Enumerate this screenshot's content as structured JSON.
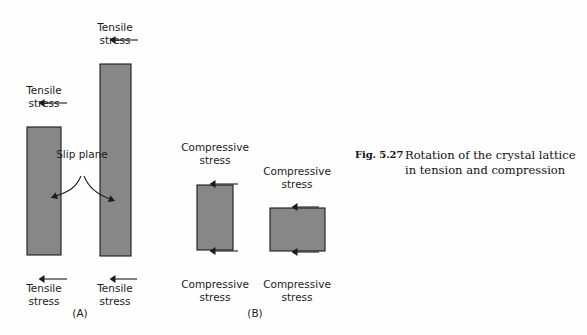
{
  "figure": {
    "background_color": "#fefefe",
    "block_fill_color": "#878787",
    "block_stroke_color": "#1a1a1a",
    "arrow_color": "#1c1c1c"
  },
  "caption": {
    "number": "Fig. 5.27",
    "text": "Rotation of the crystal lattice in tension and compression"
  },
  "panels": [
    {
      "letter": "(A)",
      "name": "tension-panel",
      "blocks": [
        {
          "name": "tall-bar-left",
          "top_label": {
            "line1": "Tensile",
            "line2": "stress"
          },
          "bottom_label": {
            "line1": "Tensile",
            "line2": "stress"
          },
          "arrow_direction_top": "up",
          "arrow_direction_bottom": "down"
        },
        {
          "name": "tall-bar-right",
          "top_label": {
            "line1": "Tensile",
            "line2": "stress"
          },
          "bottom_label": {
            "line1": "Tensile",
            "line2": "stress"
          },
          "arrow_direction_top": "up",
          "arrow_direction_bottom": "down"
        }
      ],
      "annotation": {
        "line1": "Slip",
        "line2": "plane"
      }
    },
    {
      "letter": "(B)",
      "name": "compression-panel",
      "blocks": [
        {
          "name": "short-block-left",
          "top_label": {
            "line1": "Compressive",
            "line2": "stress"
          },
          "bottom_label": {
            "line1": "Compressive",
            "line2": "stress"
          },
          "arrow_direction_top": "down",
          "arrow_direction_bottom": "up"
        },
        {
          "name": "short-block-right",
          "top_label": {
            "line1": "Compressive",
            "line2": "stress"
          },
          "bottom_label": {
            "line1": "Compressive",
            "line2": "stress"
          },
          "arrow_direction_top": "down",
          "arrow_direction_bottom": "up"
        }
      ]
    }
  ]
}
